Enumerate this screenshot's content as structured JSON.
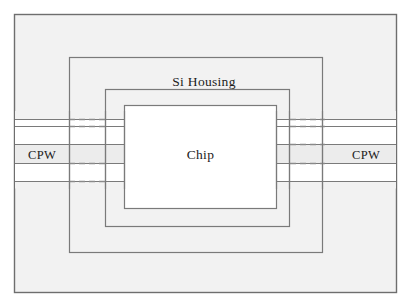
{
  "figure": {
    "type": "schematic-diagram",
    "canvas": {
      "width": 408,
      "height": 307
    },
    "colors": {
      "page_background": "#ffffff",
      "enclosure_fill": "#f2f2f2",
      "band_fill": "#ececec",
      "gap_fill": "#ffffff",
      "stroke": "#7a7a7a",
      "outer_stroke": "#6e6e6e",
      "dashed_stroke": "#8a8a8a",
      "text": "#1c1c1c"
    }
  },
  "labels": {
    "si_housing": "Si Housing",
    "chip": "Chip",
    "cpw_left": "CPW",
    "cpw_right": "CPW"
  },
  "shapes": {
    "outer_enclosure": {
      "name": "outer-enclosure",
      "x": 14,
      "y": 14,
      "width": 383,
      "height": 279
    },
    "housing_outer": {
      "name": "si-housing-outer-wall",
      "x": 69,
      "y": 57,
      "width": 254,
      "height": 196
    },
    "housing_inner": {
      "name": "si-housing-inner-wall",
      "x": 105,
      "y": 89,
      "width": 185,
      "height": 138
    },
    "chip": {
      "name": "chip-body",
      "x": 124,
      "y": 105,
      "width": 153,
      "height": 104
    }
  },
  "cpw": {
    "line_y": [
      119,
      126,
      144,
      163,
      181
    ],
    "band_fills": [
      "#ececec",
      "#ffffff",
      "#ececec",
      "#ffffff",
      "#ececec"
    ],
    "left_extent": {
      "x_start": 14,
      "x_end": 124
    },
    "right_extent": {
      "x_start": 277,
      "x_end": 397
    },
    "dashed_left": {
      "x_start": 69,
      "x_end": 105
    },
    "dashed_right": {
      "x_start": 290,
      "x_end": 323
    },
    "dash_pattern": "6 4"
  }
}
